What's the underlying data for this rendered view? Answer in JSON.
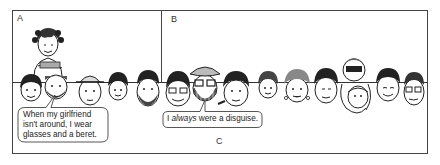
{
  "figure": {
    "regions": [
      {
        "id": "A",
        "label": "A",
        "description": "Woman hugging a man among a row of faces"
      },
      {
        "id": "B",
        "label": "B",
        "description": "Row of faces including a man in beret, glasses and beard"
      },
      {
        "id": "C",
        "label": "C",
        "description": "Region below the face line"
      }
    ],
    "bubbles": [
      {
        "id": "bubble-a",
        "lines": [
          "When my girlfriend",
          "isn't around, I wear",
          "glasses and a beret."
        ]
      },
      {
        "id": "bubble-b",
        "prefix": "I ",
        "emphasis": "always",
        "suffix": " were a disguise."
      }
    ],
    "faces": [
      {
        "id": "woman-top",
        "region": "A",
        "features": [
          "curly hair",
          "hugging"
        ]
      },
      {
        "id": "face-1",
        "region": "A",
        "features": [
          "curly hair"
        ]
      },
      {
        "id": "face-2",
        "region": "A",
        "features": [
          "beard",
          "being hugged"
        ]
      },
      {
        "id": "face-3",
        "region": "A",
        "features": [
          "hat"
        ]
      },
      {
        "id": "face-4",
        "region": "A",
        "features": [
          "curly hair"
        ]
      },
      {
        "id": "face-5",
        "region": "A",
        "features": [
          "beard",
          "dark hair"
        ]
      },
      {
        "id": "face-6",
        "region": "B",
        "features": [
          "glasses"
        ]
      },
      {
        "id": "face-7",
        "region": "B",
        "features": [
          "beret",
          "glasses",
          "checked beard"
        ]
      },
      {
        "id": "face-8",
        "region": "B",
        "features": [
          "curly hair",
          "cigar"
        ]
      },
      {
        "id": "face-9",
        "region": "B",
        "features": [
          "curly hair"
        ]
      },
      {
        "id": "face-10",
        "region": "B",
        "features": [
          "curly hair",
          "earrings"
        ]
      },
      {
        "id": "face-11",
        "region": "B",
        "features": [
          "dark hair"
        ]
      },
      {
        "id": "face-12",
        "region": "B",
        "features": [
          "hugged from above",
          "masked figure"
        ]
      },
      {
        "id": "face-13",
        "region": "B",
        "features": [
          "smiling"
        ]
      },
      {
        "id": "face-14",
        "region": "B",
        "features": [
          "glasses"
        ]
      }
    ]
  }
}
